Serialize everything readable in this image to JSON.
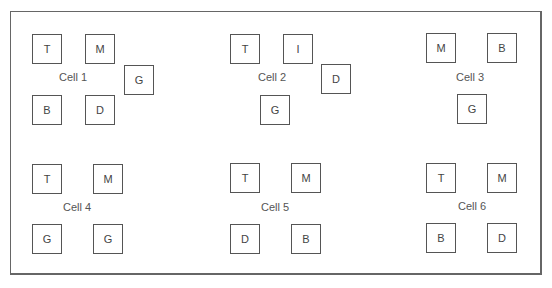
{
  "cells": [
    {
      "label": "Cell 1",
      "label_pos": [
        59,
        71
      ],
      "boxes": [
        {
          "letter": "T",
          "x": 32,
          "y": 34
        },
        {
          "letter": "M",
          "x": 85,
          "y": 34
        },
        {
          "letter": "G",
          "x": 124,
          "y": 65
        },
        {
          "letter": "B",
          "x": 32,
          "y": 95
        },
        {
          "letter": "D",
          "x": 85,
          "y": 95
        }
      ]
    },
    {
      "label": "Cell 2",
      "label_pos": [
        258,
        71
      ],
      "boxes": [
        {
          "letter": "T",
          "x": 230,
          "y": 34
        },
        {
          "letter": "I",
          "x": 283,
          "y": 34
        },
        {
          "letter": "D",
          "x": 321,
          "y": 64
        },
        {
          "letter": "G",
          "x": 260,
          "y": 95
        }
      ]
    },
    {
      "label": "Cell 3",
      "label_pos": [
        456,
        71
      ],
      "boxes": [
        {
          "letter": "M",
          "x": 426,
          "y": 33
        },
        {
          "letter": "B",
          "x": 487,
          "y": 33
        },
        {
          "letter": "G",
          "x": 457,
          "y": 94
        }
      ]
    },
    {
      "label": "Cell 4",
      "label_pos": [
        63,
        201
      ],
      "boxes": [
        {
          "letter": "T",
          "x": 32,
          "y": 164
        },
        {
          "letter": "M",
          "x": 93,
          "y": 164
        },
        {
          "letter": "G",
          "x": 32,
          "y": 224
        },
        {
          "letter": "G",
          "x": 93,
          "y": 224
        }
      ]
    },
    {
      "label": "Cell 5",
      "label_pos": [
        261,
        201
      ],
      "boxes": [
        {
          "letter": "T",
          "x": 230,
          "y": 163
        },
        {
          "letter": "M",
          "x": 291,
          "y": 163
        },
        {
          "letter": "D",
          "x": 230,
          "y": 224
        },
        {
          "letter": "B",
          "x": 291,
          "y": 224
        }
      ]
    },
    {
      "label": "Cell 6",
      "label_pos": [
        458,
        200
      ],
      "boxes": [
        {
          "letter": "T",
          "x": 426,
          "y": 163
        },
        {
          "letter": "M",
          "x": 487,
          "y": 163
        },
        {
          "letter": "B",
          "x": 426,
          "y": 223
        },
        {
          "letter": "D",
          "x": 487,
          "y": 223
        }
      ]
    }
  ]
}
